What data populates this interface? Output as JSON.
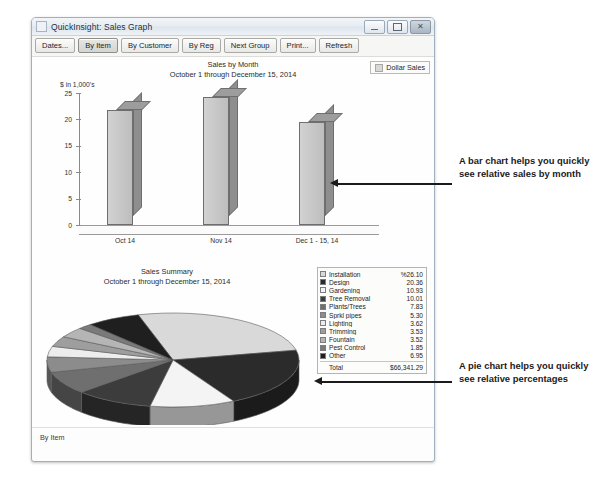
{
  "window": {
    "title": "QuickInsight: Sales Graph",
    "icon": "app-icon",
    "controls": {
      "minimize": "minimize-icon",
      "maximize": "maximize-icon",
      "close": "close-icon"
    }
  },
  "toolbar": {
    "buttons": [
      {
        "label": "Dates...",
        "selected": false
      },
      {
        "label": "By Item",
        "selected": true
      },
      {
        "label": "By Customer",
        "selected": false
      },
      {
        "label": "By Reg",
        "selected": false
      },
      {
        "label": "Next Group",
        "selected": false
      },
      {
        "label": "Print...",
        "selected": false
      },
      {
        "label": "Refresh",
        "selected": false
      }
    ]
  },
  "dollar_sales": {
    "label": "Dollar Sales"
  },
  "statusbar": {
    "text": "By Item"
  },
  "annotations": {
    "bar": "A bar chart helps you quickly see relative sales by month",
    "pie": "A pie chart helps you quickly see relative percentages"
  },
  "chart_data": [
    {
      "type": "bar",
      "title": "Sales by Month",
      "subtitle": "October 1 through December 15, 2014",
      "ylabel": "$ in 1,000's",
      "xlabel": "",
      "categories": [
        "Oct 14",
        "Nov 14",
        "Dec 1 - 15, 14"
      ],
      "values": [
        21.8,
        24.3,
        19.5
      ],
      "yticks": [
        "0",
        "5",
        "10",
        "15",
        "20",
        "25"
      ],
      "ylim": [
        0,
        25
      ],
      "grid": false,
      "legend_position": "top-right",
      "legend_entries": [
        "Dollar Sales"
      ]
    },
    {
      "type": "pie",
      "title": "Sales Summary",
      "subtitle": "October 1 through December 15, 2014",
      "value_suffix": "%",
      "total_label": "Total",
      "total_value": "$66,341.29",
      "first_value_display": "%26.10",
      "legend_position": "right",
      "slices": [
        {
          "label": "Installation",
          "value": 26.1,
          "color": "#d9d9d9"
        },
        {
          "label": "Design",
          "value": 20.36,
          "color": "#2b2b2b"
        },
        {
          "label": "Gardening",
          "value": 10.93,
          "color": "#f4f4f4"
        },
        {
          "label": "Tree Removal",
          "value": 10.01,
          "color": "#3c3c3c"
        },
        {
          "label": "Plants/Trees",
          "value": 7.83,
          "color": "#6f6f6f"
        },
        {
          "label": "Sprkl pipes",
          "value": 5.3,
          "color": "#8c8c8c"
        },
        {
          "label": "Lighting",
          "value": 3.62,
          "color": "#ededed"
        },
        {
          "label": "Trimming",
          "value": 3.53,
          "color": "#9e9e9e"
        },
        {
          "label": "Fountain",
          "value": 3.52,
          "color": "#b5b5b5"
        },
        {
          "label": "Pest Control",
          "value": 1.85,
          "color": "#7a7a7a"
        },
        {
          "label": "Other",
          "value": 6.95,
          "color": "#1f1f1f"
        }
      ]
    }
  ]
}
